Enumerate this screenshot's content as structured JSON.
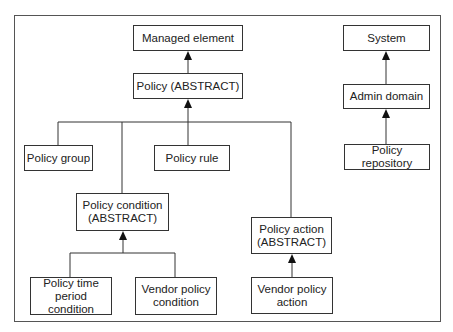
{
  "diagram": {
    "type": "class-hierarchy",
    "nodes": [
      {
        "id": "managed_element",
        "label": "Managed element"
      },
      {
        "id": "policy",
        "label": "Policy (ABSTRACT)"
      },
      {
        "id": "system",
        "label": "System"
      },
      {
        "id": "admin_domain",
        "label": "Admin domain"
      },
      {
        "id": "policy_repository",
        "label": "Policy repository"
      },
      {
        "id": "policy_group",
        "label": "Policy group"
      },
      {
        "id": "policy_rule",
        "label": "Policy rule"
      },
      {
        "id": "policy_condition",
        "label": "Policy condition (ABSTRACT)",
        "lines": [
          "Policy condition",
          "(ABSTRACT)"
        ]
      },
      {
        "id": "policy_action",
        "label": "Policy action (ABSTRACT)",
        "lines": [
          "Policy action",
          "(ABSTRACT)"
        ]
      },
      {
        "id": "policy_time_period_condition",
        "label": "Policy time period condition",
        "lines": [
          "Policy time",
          "period condition"
        ]
      },
      {
        "id": "vendor_policy_condition",
        "label": "Vendor policy condition",
        "lines": [
          "Vendor policy",
          "condition"
        ]
      },
      {
        "id": "vendor_policy_action",
        "label": "Vendor policy action",
        "lines": [
          "Vendor policy",
          "action"
        ]
      }
    ],
    "edges": [
      {
        "from": "policy",
        "to": "managed_element",
        "kind": "inherits"
      },
      {
        "from": "policy_group",
        "to": "policy",
        "kind": "inherits"
      },
      {
        "from": "policy_rule",
        "to": "policy",
        "kind": "inherits"
      },
      {
        "from": "policy_condition",
        "to": "policy",
        "kind": "inherits"
      },
      {
        "from": "policy_action",
        "to": "policy",
        "kind": "inherits"
      },
      {
        "from": "admin_domain",
        "to": "system",
        "kind": "inherits"
      },
      {
        "from": "policy_repository",
        "to": "admin_domain",
        "kind": "inherits"
      },
      {
        "from": "policy_time_period_condition",
        "to": "policy_condition",
        "kind": "inherits"
      },
      {
        "from": "vendor_policy_condition",
        "to": "policy_condition",
        "kind": "inherits"
      },
      {
        "from": "vendor_policy_action",
        "to": "policy_action",
        "kind": "inherits"
      }
    ]
  }
}
